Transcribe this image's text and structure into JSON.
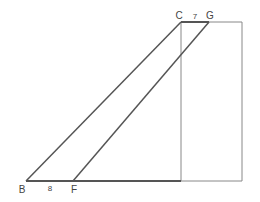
{
  "diagram": {
    "type": "geometry-figure",
    "points": {
      "B": {
        "label": "B",
        "x": 26,
        "y": 181
      },
      "F": {
        "label": "F",
        "x": 73,
        "y": 181
      },
      "C": {
        "label": "C",
        "x": 181,
        "y": 22
      },
      "G": {
        "label": "G",
        "x": 209,
        "y": 22
      }
    },
    "segment_labels": {
      "BF": "8",
      "CG": "7"
    },
    "colors": {
      "line": "#555555",
      "thin_line": "#888888",
      "text": "#444444"
    }
  }
}
